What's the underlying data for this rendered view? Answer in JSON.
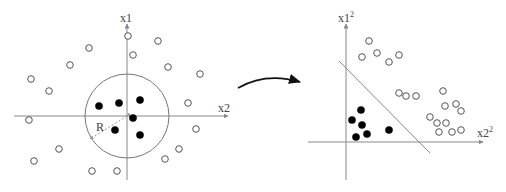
{
  "left_plot": {
    "y_axis_label": "x1",
    "x_axis_label": "x2",
    "radius_label": "R",
    "origin": [
      127,
      116
    ],
    "circle": {
      "cx": 127,
      "cy": 116,
      "r": 42
    },
    "open_points": [
      [
        128,
        36
      ],
      [
        158,
        41
      ],
      [
        89,
        48
      ],
      [
        133,
        55
      ],
      [
        70,
        65
      ],
      [
        168,
        67
      ],
      [
        31,
        79
      ],
      [
        200,
        74
      ],
      [
        49,
        91
      ],
      [
        188,
        103
      ],
      [
        29,
        120
      ],
      [
        196,
        129
      ],
      [
        59,
        149
      ],
      [
        179,
        149
      ],
      [
        165,
        159
      ],
      [
        34,
        161
      ],
      [
        92,
        171
      ],
      [
        117,
        171
      ]
    ],
    "filled_points": [
      [
        99,
        106
      ],
      [
        119,
        103
      ],
      [
        140,
        100
      ],
      [
        133,
        118
      ],
      [
        115,
        130
      ],
      [
        140,
        135
      ]
    ]
  },
  "arrow": {
    "from": [
      238,
      88
    ],
    "to": [
      303,
      82
    ]
  },
  "right_plot": {
    "y_axis_label": "x1",
    "y_axis_superscript": "2",
    "x_axis_label": "x2",
    "x_axis_superscript": "2",
    "origin": [
      346,
      142
    ],
    "separator_line": {
      "from": [
        339,
        61
      ],
      "to": [
        430,
        153
      ]
    },
    "open_points": [
      [
        369,
        41
      ],
      [
        377,
        53
      ],
      [
        362,
        57
      ],
      [
        389,
        62
      ],
      [
        399,
        55
      ],
      [
        399,
        93
      ],
      [
        406,
        96
      ],
      [
        416,
        96
      ],
      [
        443,
        91
      ],
      [
        445,
        106
      ],
      [
        456,
        104
      ],
      [
        461,
        111
      ],
      [
        430,
        117
      ],
      [
        437,
        123
      ],
      [
        446,
        123
      ],
      [
        439,
        132
      ],
      [
        452,
        132
      ],
      [
        461,
        130
      ]
    ],
    "filled_points": [
      [
        361,
        110
      ],
      [
        352,
        120
      ],
      [
        362,
        125
      ],
      [
        356,
        137
      ],
      [
        367,
        134
      ],
      [
        389,
        130
      ]
    ]
  }
}
